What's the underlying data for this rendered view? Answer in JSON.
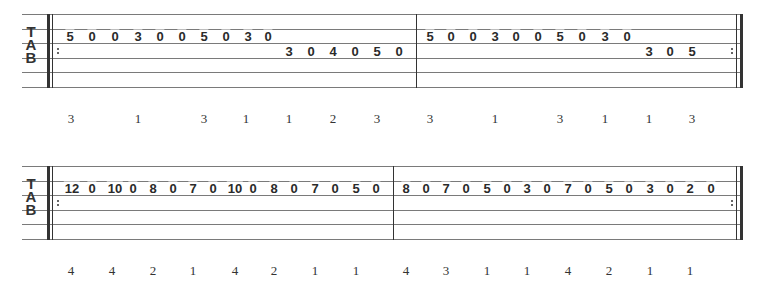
{
  "systems": [
    {
      "top": 14,
      "line_spacing": 14.6,
      "staff_left": 22,
      "staff_right": 742,
      "start_barline_x": 47,
      "mid_barline_x": 416,
      "end_barline_x": 740,
      "clef": [
        "T",
        "A",
        "B"
      ],
      "notes": [
        {
          "x": 70,
          "string": 2,
          "fret": "5"
        },
        {
          "x": 92,
          "string": 2,
          "fret": "0"
        },
        {
          "x": 115,
          "string": 2,
          "fret": "0"
        },
        {
          "x": 138,
          "string": 2,
          "fret": "3"
        },
        {
          "x": 160,
          "string": 2,
          "fret": "0"
        },
        {
          "x": 182,
          "string": 2,
          "fret": "0"
        },
        {
          "x": 204,
          "string": 2,
          "fret": "5"
        },
        {
          "x": 226,
          "string": 2,
          "fret": "0"
        },
        {
          "x": 248,
          "string": 2,
          "fret": "3"
        },
        {
          "x": 268,
          "string": 2,
          "fret": "0"
        },
        {
          "x": 289,
          "string": 3,
          "fret": "3"
        },
        {
          "x": 311,
          "string": 3,
          "fret": "0"
        },
        {
          "x": 333,
          "string": 3,
          "fret": "4"
        },
        {
          "x": 355,
          "string": 3,
          "fret": "0"
        },
        {
          "x": 377,
          "string": 3,
          "fret": "5"
        },
        {
          "x": 399,
          "string": 3,
          "fret": "0"
        },
        {
          "x": 430,
          "string": 2,
          "fret": "5"
        },
        {
          "x": 451,
          "string": 2,
          "fret": "0"
        },
        {
          "x": 473,
          "string": 2,
          "fret": "0"
        },
        {
          "x": 495,
          "string": 2,
          "fret": "3"
        },
        {
          "x": 516,
          "string": 2,
          "fret": "0"
        },
        {
          "x": 538,
          "string": 2,
          "fret": "0"
        },
        {
          "x": 560,
          "string": 2,
          "fret": "5"
        },
        {
          "x": 582,
          "string": 2,
          "fret": "0"
        },
        {
          "x": 605,
          "string": 2,
          "fret": "3"
        },
        {
          "x": 627,
          "string": 2,
          "fret": "0"
        },
        {
          "x": 649,
          "string": 3,
          "fret": "3"
        },
        {
          "x": 670,
          "string": 3,
          "fret": "0"
        },
        {
          "x": 692,
          "string": 3,
          "fret": "5"
        }
      ],
      "fingering_y": 111,
      "fingering": [
        {
          "x": 71,
          "v": "3"
        },
        {
          "x": 138,
          "v": "1"
        },
        {
          "x": 204,
          "v": "3"
        },
        {
          "x": 246,
          "v": "1"
        },
        {
          "x": 289,
          "v": "1"
        },
        {
          "x": 333,
          "v": "2"
        },
        {
          "x": 377,
          "v": "3"
        },
        {
          "x": 430,
          "v": "3"
        },
        {
          "x": 495,
          "v": "1"
        },
        {
          "x": 560,
          "v": "3"
        },
        {
          "x": 605,
          "v": "1"
        },
        {
          "x": 649,
          "v": "1"
        },
        {
          "x": 692,
          "v": "3"
        }
      ]
    },
    {
      "top": 166,
      "line_spacing": 14.6,
      "staff_left": 22,
      "staff_right": 742,
      "start_barline_x": 47,
      "mid_barline_x": 393,
      "end_barline_x": 740,
      "clef": [
        "T",
        "A",
        "B"
      ],
      "notes": [
        {
          "x": 72,
          "string": 2,
          "fret": "12"
        },
        {
          "x": 92,
          "string": 2,
          "fret": "0"
        },
        {
          "x": 115,
          "string": 2,
          "fret": "10"
        },
        {
          "x": 133,
          "string": 2,
          "fret": "0"
        },
        {
          "x": 153,
          "string": 2,
          "fret": "8"
        },
        {
          "x": 173,
          "string": 2,
          "fret": "0"
        },
        {
          "x": 193,
          "string": 2,
          "fret": "7"
        },
        {
          "x": 213,
          "string": 2,
          "fret": "0"
        },
        {
          "x": 235,
          "string": 2,
          "fret": "10"
        },
        {
          "x": 253,
          "string": 2,
          "fret": "0"
        },
        {
          "x": 274,
          "string": 2,
          "fret": "8"
        },
        {
          "x": 294,
          "string": 2,
          "fret": "0"
        },
        {
          "x": 315,
          "string": 2,
          "fret": "7"
        },
        {
          "x": 335,
          "string": 2,
          "fret": "0"
        },
        {
          "x": 356,
          "string": 2,
          "fret": "5"
        },
        {
          "x": 376,
          "string": 2,
          "fret": "0"
        },
        {
          "x": 406,
          "string": 2,
          "fret": "8"
        },
        {
          "x": 426,
          "string": 2,
          "fret": "0"
        },
        {
          "x": 446,
          "string": 2,
          "fret": "7"
        },
        {
          "x": 466,
          "string": 2,
          "fret": "0"
        },
        {
          "x": 487,
          "string": 2,
          "fret": "5"
        },
        {
          "x": 507,
          "string": 2,
          "fret": "0"
        },
        {
          "x": 527,
          "string": 2,
          "fret": "3"
        },
        {
          "x": 547,
          "string": 2,
          "fret": "0"
        },
        {
          "x": 568,
          "string": 2,
          "fret": "7"
        },
        {
          "x": 588,
          "string": 2,
          "fret": "0"
        },
        {
          "x": 609,
          "string": 2,
          "fret": "5"
        },
        {
          "x": 629,
          "string": 2,
          "fret": "0"
        },
        {
          "x": 650,
          "string": 2,
          "fret": "3"
        },
        {
          "x": 670,
          "string": 2,
          "fret": "0"
        },
        {
          "x": 690,
          "string": 2,
          "fret": "2"
        },
        {
          "x": 711,
          "string": 2,
          "fret": "0"
        }
      ],
      "fingering_y": 263,
      "fingering": [
        {
          "x": 71,
          "v": "4"
        },
        {
          "x": 112,
          "v": "4"
        },
        {
          "x": 153,
          "v": "2"
        },
        {
          "x": 193,
          "v": "1"
        },
        {
          "x": 235,
          "v": "4"
        },
        {
          "x": 274,
          "v": "2"
        },
        {
          "x": 315,
          "v": "1"
        },
        {
          "x": 356,
          "v": "1"
        },
        {
          "x": 406,
          "v": "4"
        },
        {
          "x": 446,
          "v": "3"
        },
        {
          "x": 487,
          "v": "1"
        },
        {
          "x": 527,
          "v": "1"
        },
        {
          "x": 568,
          "v": "4"
        },
        {
          "x": 609,
          "v": "2"
        },
        {
          "x": 650,
          "v": "1"
        },
        {
          "x": 690,
          "v": "1"
        }
      ]
    }
  ]
}
